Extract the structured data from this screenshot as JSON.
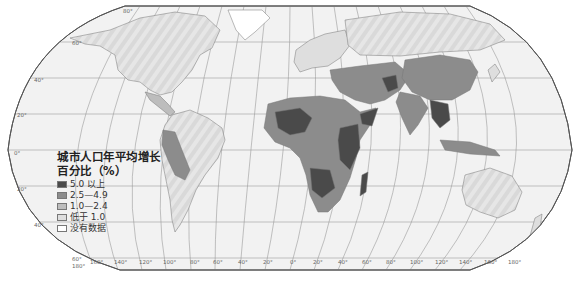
{
  "map": {
    "title": "城市人口年平均增长百分比（%）",
    "legend": {
      "title_line1": "城市人口年平均增长",
      "title_line2": "百分比（%）",
      "items": [
        {
          "label": "5.0 以上",
          "color": "#4a4a4a"
        },
        {
          "label": "2.5—4.9",
          "color": "#8c8c8c"
        },
        {
          "label": "1.0—2.4",
          "color": "#bdbdbd"
        },
        {
          "label": "低于 1.0",
          "color": "#dedede"
        },
        {
          "label": "没有数据",
          "color": "#ffffff"
        }
      ]
    },
    "latitude_labels": [
      {
        "label": "80°",
        "x": 123,
        "y": 8
      },
      {
        "label": "60°",
        "x": 72,
        "y": 40
      },
      {
        "label": "40°",
        "x": 34,
        "y": 77
      },
      {
        "label": "20°",
        "x": 17,
        "y": 112
      },
      {
        "label": "0°",
        "x": 14,
        "y": 150
      },
      {
        "label": "20°",
        "x": 17,
        "y": 186
      },
      {
        "label": "40°",
        "x": 34,
        "y": 222
      },
      {
        "label": "60°",
        "x": 72,
        "y": 256
      }
    ],
    "longitude_labels": [
      {
        "label": "180°",
        "x": 72,
        "y": 263
      },
      {
        "label": "160°",
        "x": 90,
        "y": 259
      },
      {
        "label": "140°",
        "x": 114,
        "y": 259
      },
      {
        "label": "120°",
        "x": 139,
        "y": 259
      },
      {
        "label": "100°",
        "x": 163,
        "y": 259
      },
      {
        "label": "80°",
        "x": 190,
        "y": 259
      },
      {
        "label": "60°",
        "x": 213,
        "y": 259
      },
      {
        "label": "40°",
        "x": 238,
        "y": 259
      },
      {
        "label": "20°",
        "x": 263,
        "y": 259
      },
      {
        "label": "0°",
        "x": 290,
        "y": 259
      },
      {
        "label": "20°",
        "x": 313,
        "y": 259
      },
      {
        "label": "40°",
        "x": 338,
        "y": 259
      },
      {
        "label": "60°",
        "x": 362,
        "y": 259
      },
      {
        "label": "80°",
        "x": 386,
        "y": 259
      },
      {
        "label": "100°",
        "x": 410,
        "y": 259
      },
      {
        "label": "120°",
        "x": 435,
        "y": 259
      },
      {
        "label": "140°",
        "x": 459,
        "y": 259
      },
      {
        "label": "160°",
        "x": 484,
        "y": 259
      },
      {
        "label": "180°",
        "x": 508,
        "y": 259
      }
    ],
    "colors": {
      "ocean": "#f1f1f1",
      "grid": "#8a8a8a",
      "border": "#777777",
      "outline": "#555555"
    }
  }
}
